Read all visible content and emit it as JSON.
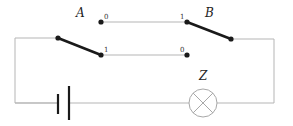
{
  "diagram": {
    "type": "circuit",
    "labels": {
      "switch_a": "A",
      "switch_b": "B",
      "lamp": "Z"
    },
    "terminals": {
      "top_left": "0",
      "top_right": "1",
      "bottom_left": "1",
      "bottom_right": "0"
    },
    "components": [
      {
        "id": "A",
        "kind": "two-way switch",
        "position": "connected to terminal 1 (lower)"
      },
      {
        "id": "B",
        "kind": "two-way switch",
        "position": "connected to terminal 1 (upper)"
      },
      {
        "id": "battery",
        "kind": "cell"
      },
      {
        "id": "Z",
        "kind": "lamp"
      }
    ],
    "colors": {
      "wire": "#b5b5b5",
      "switch": "#1a1a1a",
      "lamp": "#a8a8a8"
    }
  }
}
